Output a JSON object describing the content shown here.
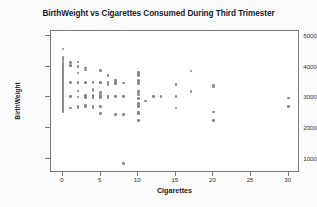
{
  "chart_data": {
    "type": "scatter",
    "title": "BirthWeight vs Cigarettes Consumed During Third Trimester",
    "xlabel": "Cigarettes",
    "ylabel": "BirthWeight",
    "xlim": [
      -1.6,
      31.5
    ],
    "ylim": [
      550,
      5150
    ],
    "xticks": [
      0,
      5,
      10,
      15,
      20,
      25,
      30
    ],
    "yticks": [
      1000,
      2000,
      3000,
      4000,
      5000
    ],
    "grid": false,
    "legend": null,
    "marker_color": "#8a8a8a",
    "frame_color": "#7a7a7a",
    "points": [
      [
        0,
        4570
      ],
      [
        0,
        4300
      ],
      [
        0,
        4230
      ],
      [
        0,
        4150
      ],
      [
        0,
        4120
      ],
      [
        0,
        4080
      ],
      [
        0,
        4050
      ],
      [
        0,
        4010
      ],
      [
        0,
        3980
      ],
      [
        0,
        3950
      ],
      [
        0,
        3910
      ],
      [
        0,
        3880
      ],
      [
        0,
        3850
      ],
      [
        0,
        3820
      ],
      [
        0,
        3790
      ],
      [
        0,
        3760
      ],
      [
        0,
        3730
      ],
      [
        0,
        3700
      ],
      [
        0,
        3670
      ],
      [
        0,
        3640
      ],
      [
        0,
        3610
      ],
      [
        0,
        3580
      ],
      [
        0,
        3550
      ],
      [
        0,
        3520
      ],
      [
        0,
        3490
      ],
      [
        0,
        3460
      ],
      [
        0,
        3430
      ],
      [
        0,
        3400
      ],
      [
        0,
        3370
      ],
      [
        0,
        3340
      ],
      [
        0,
        3310
      ],
      [
        0,
        3280
      ],
      [
        0,
        3250
      ],
      [
        0,
        3220
      ],
      [
        0,
        3190
      ],
      [
        0,
        3160
      ],
      [
        0,
        3130
      ],
      [
        0,
        3100
      ],
      [
        0,
        3070
      ],
      [
        0,
        3040
      ],
      [
        0,
        3010
      ],
      [
        0,
        2980
      ],
      [
        0,
        2950
      ],
      [
        0,
        2920
      ],
      [
        0,
        2890
      ],
      [
        0,
        2860
      ],
      [
        0,
        2830
      ],
      [
        0,
        2800
      ],
      [
        0,
        2770
      ],
      [
        0,
        2740
      ],
      [
        0,
        2710
      ],
      [
        0,
        2680
      ],
      [
        0,
        2650
      ],
      [
        0,
        2620
      ],
      [
        0,
        2580
      ],
      [
        0,
        2540
      ],
      [
        0,
        2760
      ],
      [
        1,
        4130
      ],
      [
        1,
        4040
      ],
      [
        1,
        4010
      ],
      [
        1,
        3480
      ],
      [
        1,
        3030
      ],
      [
        1,
        2660
      ],
      [
        2,
        4150
      ],
      [
        2,
        4000
      ],
      [
        2,
        3790
      ],
      [
        2,
        3490
      ],
      [
        2,
        3470
      ],
      [
        2,
        3200
      ],
      [
        2,
        3010
      ],
      [
        2,
        2700
      ],
      [
        2,
        2680
      ],
      [
        3,
        3950
      ],
      [
        3,
        3890
      ],
      [
        3,
        3490
      ],
      [
        3,
        3470
      ],
      [
        3,
        3060
      ],
      [
        3,
        3010
      ],
      [
        3,
        2990
      ],
      [
        3,
        2740
      ],
      [
        3,
        2700
      ],
      [
        4,
        3480
      ],
      [
        4,
        3250
      ],
      [
        4,
        3210
      ],
      [
        4,
        3060
      ],
      [
        4,
        3030
      ],
      [
        4,
        3000
      ],
      [
        4,
        2700
      ],
      [
        4,
        2680
      ],
      [
        5,
        3870
      ],
      [
        5,
        3490
      ],
      [
        5,
        3470
      ],
      [
        5,
        3160
      ],
      [
        5,
        3060
      ],
      [
        5,
        3030
      ],
      [
        5,
        3000
      ],
      [
        5,
        2710
      ],
      [
        5,
        2470
      ],
      [
        6,
        3700
      ],
      [
        6,
        3490
      ],
      [
        6,
        3410
      ],
      [
        6,
        3050
      ],
      [
        6,
        3020
      ],
      [
        6,
        2990
      ],
      [
        7,
        3540
      ],
      [
        7,
        3480
      ],
      [
        7,
        3440
      ],
      [
        7,
        3030
      ],
      [
        7,
        2440
      ],
      [
        8,
        3470
      ],
      [
        8,
        3030
      ],
      [
        8,
        2450
      ],
      [
        8,
        850
      ],
      [
        10,
        3800
      ],
      [
        10,
        3750
      ],
      [
        10,
        3700
      ],
      [
        10,
        3540
      ],
      [
        10,
        3500
      ],
      [
        10,
        3440
      ],
      [
        10,
        3200
      ],
      [
        10,
        3150
      ],
      [
        10,
        3080
      ],
      [
        10,
        2960
      ],
      [
        10,
        2800
      ],
      [
        10,
        2750
      ],
      [
        10,
        2700
      ],
      [
        10,
        2520
      ],
      [
        10,
        2480
      ],
      [
        10,
        2260
      ],
      [
        11,
        2880
      ],
      [
        12,
        3020
      ],
      [
        13,
        3030
      ],
      [
        15,
        3420
      ],
      [
        15,
        3030
      ],
      [
        15,
        2660
      ],
      [
        17,
        3850
      ],
      [
        17,
        3190
      ],
      [
        20,
        3380
      ],
      [
        20,
        3330
      ],
      [
        20,
        2530
      ],
      [
        20,
        2250
      ],
      [
        30,
        2980
      ],
      [
        30,
        2710
      ]
    ]
  }
}
